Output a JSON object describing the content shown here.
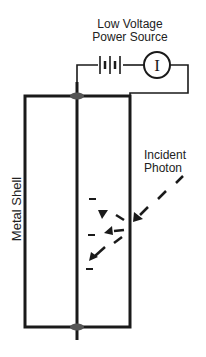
{
  "labels": {
    "power_source_line1": "Low Voltage",
    "power_source_line2": "Power Source",
    "meter_symbol": "I",
    "metal_shell": "Metal Shell",
    "incident_line1": "Incident",
    "incident_line2": "Photon",
    "electron_charge": "−"
  },
  "colors": {
    "line": "#1a1a1a",
    "seal": "#555555",
    "background": "#ffffff"
  }
}
